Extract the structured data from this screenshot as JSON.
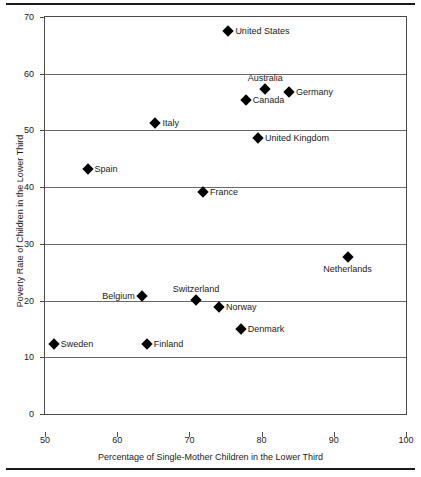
{
  "chart_data": {
    "type": "scatter",
    "title": "",
    "xlabel": "Percentage of Single-Mother Children in the Lower Third",
    "ylabel": "Poverty Rate of Children in the Lower Third",
    "xlim": [
      50,
      100
    ],
    "ylim": [
      0,
      70
    ],
    "xticks": [
      50,
      60,
      70,
      80,
      90,
      100
    ],
    "yticks": [
      0,
      10,
      20,
      30,
      40,
      50,
      60,
      70
    ],
    "grid": "horizontal",
    "legend": "none",
    "marker": "filled-diamond",
    "marker_color": "#000000",
    "points": [
      {
        "label": "United States",
        "x": 75.4,
        "y": 67.6,
        "label_pos": "right"
      },
      {
        "label": "Australia",
        "x": 80.5,
        "y": 57.3,
        "label_pos": "above"
      },
      {
        "label": "Germany",
        "x": 83.8,
        "y": 56.7,
        "label_pos": "right"
      },
      {
        "label": "Canada",
        "x": 77.8,
        "y": 55.4,
        "label_pos": "right"
      },
      {
        "label": "Italy",
        "x": 65.3,
        "y": 51.3,
        "label_pos": "right"
      },
      {
        "label": "United Kingdom",
        "x": 79.5,
        "y": 48.6,
        "label_pos": "right"
      },
      {
        "label": "Spain",
        "x": 55.9,
        "y": 43.2,
        "label_pos": "right"
      },
      {
        "label": "France",
        "x": 71.9,
        "y": 39.2,
        "label_pos": "right"
      },
      {
        "label": "Netherlands",
        "x": 91.9,
        "y": 27.7,
        "label_pos": "below"
      },
      {
        "label": "Belgium",
        "x": 63.4,
        "y": 20.8,
        "label_pos": "left"
      },
      {
        "label": "Switzerland",
        "x": 70.9,
        "y": 20.1,
        "label_pos": "above"
      },
      {
        "label": "Norway",
        "x": 74.1,
        "y": 18.9,
        "label_pos": "right"
      },
      {
        "label": "Denmark",
        "x": 77.1,
        "y": 14.9,
        "label_pos": "right"
      },
      {
        "label": "Sweden",
        "x": 51.2,
        "y": 12.3,
        "label_pos": "right"
      },
      {
        "label": "Finland",
        "x": 64.1,
        "y": 12.3,
        "label_pos": "right"
      }
    ]
  }
}
